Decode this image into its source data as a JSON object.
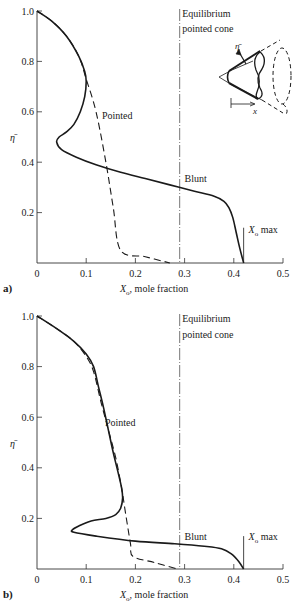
{
  "figure": {
    "panels": [
      "a)",
      "b)"
    ]
  },
  "chart_data": [
    {
      "type": "line",
      "panel_label": "a)",
      "xlabel": "X_o, mole fraction",
      "xlabel_main": "X",
      "xlabel_sub": "o",
      "xlabel_rest": ", mole fraction",
      "ylabel": "η̄",
      "xlim": [
        0,
        0.5
      ],
      "ylim": [
        0,
        1.0
      ],
      "xticks": [
        0,
        0.1,
        0.2,
        0.3,
        0.4,
        0.5
      ],
      "xtick_labels": [
        "0",
        "0.1",
        "0.2",
        "0.3",
        "0.4",
        "0.5"
      ],
      "yticks": [
        0.2,
        0.4,
        0.6,
        0.8,
        1.0
      ],
      "ytick_labels": [
        "0.2",
        "0.4",
        "0.6",
        "0.8",
        "1.0"
      ],
      "grid": false,
      "series": [
        {
          "name": "Blunt",
          "style": "solid",
          "x": [
            0.0,
            0.03,
            0.06,
            0.085,
            0.097,
            0.1,
            0.097,
            0.088,
            0.075,
            0.06,
            0.045,
            0.04,
            0.05,
            0.08,
            0.12,
            0.17,
            0.22,
            0.27,
            0.32,
            0.36,
            0.38,
            0.39,
            0.398,
            0.405,
            0.412,
            0.42
          ],
          "y": [
            1.0,
            0.96,
            0.9,
            0.82,
            0.76,
            0.72,
            0.66,
            0.6,
            0.55,
            0.52,
            0.5,
            0.48,
            0.45,
            0.42,
            0.39,
            0.36,
            0.335,
            0.31,
            0.285,
            0.265,
            0.245,
            0.22,
            0.18,
            0.12,
            0.06,
            0.0
          ]
        },
        {
          "name": "Pointed",
          "style": "dashed",
          "x": [
            0.0,
            0.03,
            0.06,
            0.085,
            0.1,
            0.12,
            0.14,
            0.155,
            0.17,
            0.22,
            0.27
          ],
          "y": [
            1.0,
            0.96,
            0.9,
            0.82,
            0.73,
            0.6,
            0.4,
            0.22,
            0.05,
            0.025,
            0.0
          ]
        }
      ],
      "reference_lines": [
        {
          "name": "Equilibrium pointed cone",
          "x": 0.29,
          "style": "dash-dot"
        },
        {
          "name": "X_o max",
          "x": 0.42,
          "style": "solid",
          "y_range": [
            0,
            0.14
          ]
        }
      ],
      "annotations": [
        {
          "text": "Equilibrium",
          "x": 0.295,
          "y": 0.975
        },
        {
          "text": "pointed cone",
          "x": 0.295,
          "y": 0.915
        },
        {
          "text": "Pointed",
          "x": 0.132,
          "y": 0.57
        },
        {
          "text": "Blunt",
          "x": 0.3,
          "y": 0.32
        },
        {
          "text": "X_o max",
          "x": 0.43,
          "y": 0.12
        }
      ],
      "inset": "cone schematic with η̄ and x axes"
    },
    {
      "type": "line",
      "panel_label": "b)",
      "xlabel": "X_o, mole fraction",
      "xlabel_main": "X",
      "xlabel_sub": "o",
      "xlabel_rest": ", mole fraction",
      "ylabel": "η̄",
      "xlim": [
        0,
        0.5
      ],
      "ylim": [
        0,
        1.0
      ],
      "xticks": [
        0,
        0.1,
        0.2,
        0.3,
        0.4,
        0.5
      ],
      "xtick_labels": [
        "0",
        "0.1",
        "0.2",
        "0.3",
        "0.4",
        "0.5"
      ],
      "yticks": [
        0.2,
        0.4,
        0.6,
        0.8,
        1.0
      ],
      "ytick_labels": [
        "0.2",
        "0.4",
        "0.6",
        "0.8",
        "1.0"
      ],
      "grid": false,
      "series": [
        {
          "name": "Blunt",
          "style": "solid",
          "x": [
            0.0,
            0.04,
            0.075,
            0.1,
            0.115,
            0.125,
            0.135,
            0.145,
            0.155,
            0.165,
            0.172,
            0.174,
            0.17,
            0.16,
            0.14,
            0.11,
            0.085,
            0.072,
            0.075,
            0.12,
            0.2,
            0.28,
            0.34,
            0.375,
            0.395,
            0.41,
            0.42
          ],
          "y": [
            1.0,
            0.95,
            0.9,
            0.85,
            0.8,
            0.72,
            0.64,
            0.55,
            0.46,
            0.38,
            0.32,
            0.28,
            0.24,
            0.215,
            0.2,
            0.19,
            0.17,
            0.155,
            0.145,
            0.13,
            0.11,
            0.1,
            0.09,
            0.08,
            0.06,
            0.03,
            0.0
          ]
        },
        {
          "name": "Pointed",
          "style": "dashed",
          "x": [
            0.0,
            0.04,
            0.075,
            0.1,
            0.115,
            0.13,
            0.145,
            0.16,
            0.172,
            0.18,
            0.19,
            0.195,
            0.24,
            0.285
          ],
          "y": [
            1.0,
            0.95,
            0.9,
            0.84,
            0.78,
            0.66,
            0.55,
            0.44,
            0.32,
            0.22,
            0.1,
            0.05,
            0.025,
            0.0
          ]
        }
      ],
      "reference_lines": [
        {
          "name": "Equilibrium pointed cone",
          "x": 0.29,
          "style": "dash-dot"
        },
        {
          "name": "X_o max",
          "x": 0.42,
          "style": "solid",
          "y_range": [
            0,
            0.13
          ]
        }
      ],
      "annotations": [
        {
          "text": "Equilibrium",
          "x": 0.295,
          "y": 0.975
        },
        {
          "text": "pointed cone",
          "x": 0.295,
          "y": 0.915
        },
        {
          "text": "Pointed",
          "x": 0.138,
          "y": 0.565
        },
        {
          "text": "Blunt",
          "x": 0.3,
          "y": 0.115
        },
        {
          "text": "X_o max",
          "x": 0.43,
          "y": 0.115
        }
      ]
    }
  ]
}
